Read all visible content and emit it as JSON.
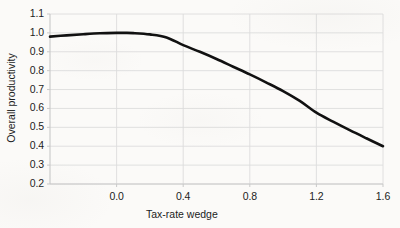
{
  "chart_data": {
    "type": "line",
    "title": "",
    "subtitle": "",
    "xlabel": "Tax-rate wedge",
    "ylabel": "Overall productivity",
    "xlim": [
      -0.4,
      1.6
    ],
    "ylim": [
      0.2,
      1.1
    ],
    "xticks": [
      "0.0",
      "0.4",
      "0.8",
      "1.2",
      "1.6"
    ],
    "xtick_values": [
      0.0,
      0.4,
      0.8,
      1.2,
      1.6
    ],
    "yticks": [
      "0.2",
      "0.3",
      "0.4",
      "0.5",
      "0.6",
      "0.7",
      "0.8",
      "0.9",
      "1.0",
      "1.1"
    ],
    "ytick_values": [
      0.2,
      0.3,
      0.4,
      0.5,
      0.6,
      0.7,
      0.8,
      0.9,
      1.0,
      1.1
    ],
    "grid": true,
    "grid_axis": "both",
    "legend": false,
    "legend_position": "none",
    "annotations": [],
    "series": [
      {
        "name": "Overall productivity",
        "color": "#111111",
        "line_width": 2.6,
        "x": [
          -0.4,
          -0.3,
          -0.2,
          -0.1,
          0.0,
          0.05,
          0.1,
          0.2,
          0.3,
          0.4,
          0.5,
          0.6,
          0.7,
          0.8,
          0.9,
          1.0,
          1.1,
          1.2,
          1.3,
          1.4,
          1.5,
          1.6
        ],
        "y": [
          0.98,
          0.987,
          0.993,
          0.998,
          1.0,
          1.0,
          0.999,
          0.992,
          0.976,
          0.935,
          0.9,
          0.862,
          0.821,
          0.78,
          0.737,
          0.692,
          0.64,
          0.578,
          0.53,
          0.485,
          0.442,
          0.4
        ]
      }
    ]
  },
  "style": {
    "background": "#fbfaf8",
    "grid_color": "#dcdcdc",
    "axis_color": "#c9c9c9",
    "text_color": "#1c1c1c",
    "line_color": "#111111"
  }
}
